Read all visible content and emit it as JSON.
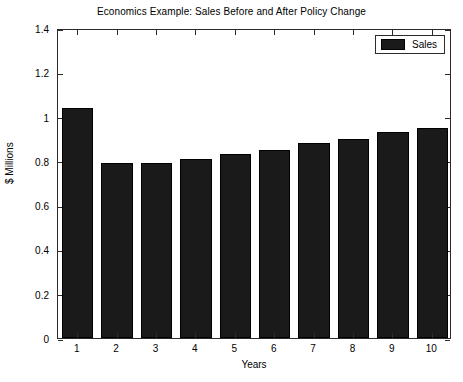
{
  "chart_data": {
    "type": "bar",
    "title": "Economics Example: Sales Before and After Policy Change",
    "xlabel": "Years",
    "ylabel": "$ Millions",
    "categories": [
      "1",
      "2",
      "3",
      "4",
      "5",
      "6",
      "7",
      "8",
      "9",
      "10"
    ],
    "series": [
      {
        "name": "Sales",
        "color": "#1a1a1a",
        "values": [
          1.04,
          0.79,
          0.79,
          0.81,
          0.83,
          0.85,
          0.88,
          0.9,
          0.93,
          0.95
        ]
      }
    ],
    "ylim": [
      0,
      1.4
    ],
    "yticks": [
      0,
      0.2,
      0.4,
      0.6,
      0.8,
      1.0,
      1.2,
      1.4
    ],
    "ytick_labels": [
      "0",
      "0.2",
      "0.4",
      "0.6",
      "0.8",
      "1",
      "1.2",
      "1.4"
    ],
    "xtick_labels": [
      "1",
      "2",
      "3",
      "4",
      "5",
      "6",
      "7",
      "8",
      "9",
      "10"
    ],
    "grid": false,
    "legend": {
      "position": "top-right",
      "entries": [
        {
          "label": "Sales",
          "color": "#1a1a1a"
        }
      ]
    },
    "axes": {
      "box": true,
      "tick_direction": "in",
      "axis_color": "#2b2b2b",
      "background": "#ffffff"
    }
  }
}
